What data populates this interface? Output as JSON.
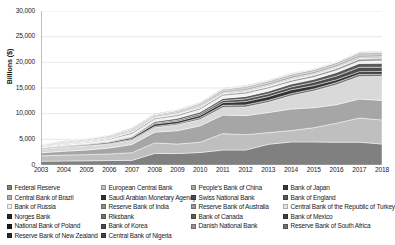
{
  "chart_data": {
    "type": "area",
    "stacked": true,
    "title": "",
    "xlabel": "",
    "ylabel": "Billions ($)",
    "ylim": [
      0,
      30000
    ],
    "ytick_labels": [
      "0",
      "5,000",
      "10,000",
      "15,000",
      "20,000",
      "25,000",
      "30,000"
    ],
    "ytick_values": [
      0,
      5000,
      10000,
      15000,
      20000,
      25000,
      30000
    ],
    "grid": true,
    "legend_position": "bottom",
    "x": [
      2003,
      2004,
      2005,
      2006,
      2007,
      2008,
      2009,
      2010,
      2011,
      2012,
      2013,
      2014,
      2015,
      2016,
      2017,
      2018
    ],
    "xtick_labels": [
      "2003",
      "2004",
      "2005",
      "2006",
      "2007",
      "2008",
      "2009",
      "2010",
      "2011",
      "2012",
      "2013",
      "2014",
      "2015",
      "2016",
      "2017",
      "2018"
    ],
    "series": [
      {
        "name": "Federal Reserve",
        "color": "#808080",
        "values": [
          730,
          780,
          820,
          870,
          900,
          2250,
          2230,
          2430,
          2920,
          2910,
          4030,
          4500,
          4490,
          4450,
          4450,
          4080
        ]
      },
      {
        "name": "European Central Bank",
        "color": "#bfbfbf",
        "values": [
          1050,
          1150,
          1200,
          1280,
          1500,
          2050,
          1850,
          2000,
          3200,
          3000,
          2280,
          2200,
          2780,
          3700,
          4700,
          4700
        ]
      },
      {
        "name": "People's Bank of China",
        "color": "#a6a6a6",
        "values": [
          600,
          750,
          900,
          1150,
          1600,
          2100,
          2600,
          3200,
          3600,
          3700,
          3900,
          4200,
          3900,
          3600,
          3700,
          3800
        ]
      },
      {
        "name": "Bank of Japan",
        "color": "#d9d9d9",
        "values": [
          700,
          800,
          820,
          800,
          820,
          900,
          1150,
          1250,
          1500,
          1700,
          2000,
          2600,
          3250,
          3900,
          4400,
          4700
        ]
      },
      {
        "name": "Central Bank of Brazil",
        "color": "#6e6e6e",
        "values": [
          60,
          70,
          80,
          110,
          200,
          230,
          260,
          330,
          400,
          400,
          390,
          400,
          400,
          400,
          420,
          420
        ]
      },
      {
        "name": "Saudi Arabian Monetary Agency",
        "color": "#333333",
        "values": [
          90,
          110,
          150,
          220,
          310,
          450,
          420,
          450,
          530,
          650,
          720,
          740,
          650,
          550,
          510,
          510
        ]
      },
      {
        "name": "Swiss National Bank",
        "color": "#4d4d4d",
        "values": [
          80,
          90,
          100,
          110,
          120,
          180,
          230,
          290,
          400,
          520,
          540,
          570,
          660,
          750,
          850,
          840
        ]
      },
      {
        "name": "Bank of England",
        "color": "#595959",
        "values": [
          60,
          70,
          80,
          90,
          140,
          290,
          350,
          370,
          420,
          480,
          520,
          560,
          570,
          670,
          750,
          780
        ]
      },
      {
        "name": "Bank of Russia",
        "color": "#f2f2f2",
        "values": [
          80,
          120,
          180,
          300,
          470,
          430,
          420,
          480,
          500,
          540,
          510,
          390,
          370,
          390,
          430,
          470
        ]
      },
      {
        "name": "Reserve Bank of India",
        "color": "#8c8c8c",
        "values": [
          100,
          130,
          140,
          180,
          280,
          250,
          280,
          300,
          300,
          300,
          300,
          330,
          360,
          370,
          410,
          400
        ]
      },
      {
        "name": "Reserve Bank of Australia",
        "color": "#999999",
        "values": [
          40,
          45,
          50,
          60,
          70,
          90,
          95,
          100,
          110,
          110,
          110,
          120,
          125,
          130,
          135,
          140
        ]
      },
      {
        "name": "Central Bank of the Republic of Turkey",
        "color": "#e6e6e6",
        "values": [
          35,
          40,
          55,
          65,
          75,
          75,
          75,
          90,
          90,
          120,
          130,
          130,
          120,
          110,
          110,
          100
        ]
      },
      {
        "name": "Norges Bank",
        "color": "#262626",
        "values": [
          45,
          50,
          55,
          60,
          70,
          75,
          80,
          90,
          100,
          110,
          120,
          120,
          110,
          110,
          120,
          120
        ]
      },
      {
        "name": "Riksbank",
        "color": "#737373",
        "values": [
          25,
          28,
          30,
          32,
          35,
          40,
          50,
          55,
          55,
          60,
          65,
          65,
          65,
          65,
          65,
          65
        ]
      },
      {
        "name": "Bank of Canada",
        "color": "#5c5c5c",
        "values": [
          40,
          42,
          44,
          46,
          48,
          55,
          60,
          62,
          65,
          70,
          80,
          85,
          90,
          95,
          100,
          105
        ]
      },
      {
        "name": "Bank of Mexico",
        "color": "#3f3f3f",
        "values": [
          60,
          65,
          70,
          78,
          85,
          95,
          100,
          120,
          145,
          165,
          180,
          195,
          180,
          178,
          175,
          176
        ]
      },
      {
        "name": "National Bank of Poland",
        "color": "#1a1a1a",
        "values": [
          35,
          37,
          40,
          48,
          65,
          62,
          80,
          95,
          100,
          110,
          105,
          100,
          95,
          115,
          115,
          115
        ]
      },
      {
        "name": "Bank of Korea",
        "color": "#b3b3b3",
        "values": [
          155,
          200,
          210,
          240,
          262,
          201,
          270,
          292,
          307,
          327,
          346,
          364,
          368,
          371,
          389,
          403
        ]
      },
      {
        "name": "Danish National Bank",
        "color": "#949494",
        "values": [
          40,
          42,
          44,
          46,
          48,
          50,
          60,
          75,
          90,
          92,
          90,
          85,
          80,
          78,
          76,
          75
        ]
      },
      {
        "name": "Reserve Bank of South Africa",
        "color": "#707070",
        "values": [
          10,
          14,
          20,
          25,
          33,
          34,
          39,
          44,
          49,
          50,
          50,
          49,
          46,
          47,
          50,
          52
        ]
      },
      {
        "name": "Reserve Bank of New Zealand",
        "color": "#2b2b2b",
        "values": [
          7,
          8,
          9,
          10,
          12,
          15,
          16,
          17,
          18,
          18,
          18,
          17,
          17,
          18,
          19,
          20
        ]
      },
      {
        "name": "Central Bank of Nigeria",
        "color": "#454545",
        "values": [
          8,
          10,
          18,
          32,
          45,
          53,
          45,
          35,
          35,
          47,
          45,
          37,
          30,
          28,
          40,
          45
        ]
      }
    ]
  },
  "legend": {
    "columns": [
      [
        {
          "label": "Federal Reserve",
          "color": "#808080"
        },
        {
          "label": "Central Bank of Brazil",
          "color": "#b0b0b0"
        },
        {
          "label": "Bank of Russia",
          "color": "#f2f2f2"
        },
        {
          "label": "Norges Bank",
          "color": "#262626"
        },
        {
          "label": "National Bank of Poland",
          "color": "#1a1a1a"
        },
        {
          "label": "Reserve Bank of New Zealand",
          "color": "#2b2b2b"
        }
      ],
      [
        {
          "label": "European Central Bank",
          "color": "#bfbfbf"
        },
        {
          "label": "Saudi Arabian Monetary Agency",
          "color": "#333333"
        },
        {
          "label": "Reserve Bank of India",
          "color": "#8c8c8c"
        },
        {
          "label": "Riksbank",
          "color": "#737373"
        },
        {
          "label": "Bank of Korea",
          "color": "#4a4a4a"
        },
        {
          "label": "Central Bank of Nigeria",
          "color": "#454545"
        }
      ],
      [
        {
          "label": "People's Bank of China",
          "color": "#a6a6a6"
        },
        {
          "label": "Swiss National Bank",
          "color": "#4d4d4d"
        },
        {
          "label": "Reserve Bank of Australia",
          "color": "#999999"
        },
        {
          "label": "Bank of Canada",
          "color": "#5c5c5c"
        },
        {
          "label": "Danish National Bank",
          "color": "#949494"
        }
      ],
      [
        {
          "label": "Bank of Japan",
          "color": "#3a3a3a"
        },
        {
          "label": "Bank of England",
          "color": "#595959"
        },
        {
          "label": "Central Bank of the Republic of Turkey",
          "color": "#e6e6e6"
        },
        {
          "label": "Bank of Mexico",
          "color": "#3f3f3f"
        },
        {
          "label": "Reserve Bank of South Africa",
          "color": "#707070"
        }
      ]
    ]
  }
}
